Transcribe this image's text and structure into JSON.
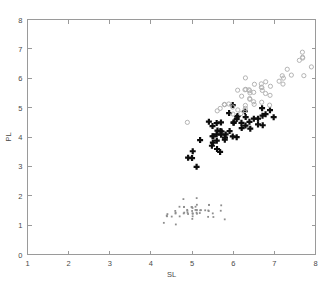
{
  "chart_data": {
    "type": "scatter",
    "title": "",
    "xlabel": "SL",
    "ylabel": "PL",
    "xlim": [
      1,
      8
    ],
    "ylim": [
      0,
      8
    ],
    "xticks": [
      1,
      2,
      3,
      4,
      5,
      6,
      7,
      8
    ],
    "yticks": [
      0,
      1,
      2,
      3,
      4,
      5,
      6,
      7,
      8
    ],
    "xtick_labels": [
      "1",
      "2",
      "3",
      "4",
      "5",
      "6",
      "7",
      "8"
    ],
    "ytick_labels": [
      "0",
      "1",
      "2",
      "3",
      "4",
      "5",
      "6",
      "7",
      "8"
    ],
    "grid": false,
    "legend": "none",
    "colors": {
      "setosa": "#8e8e8e",
      "versicolor": "#0d0d0d",
      "virginica": "#b4b4b4",
      "axis": "#9a9a9a",
      "text": "#4a4a4a",
      "background": "#ffffff"
    },
    "series": [
      {
        "name": "setosa",
        "marker": "dot",
        "color": "#8e8e8e",
        "points": [
          [
            5.1,
            1.4
          ],
          [
            4.9,
            1.4
          ],
          [
            4.7,
            1.3
          ],
          [
            4.6,
            1.5
          ],
          [
            5.0,
            1.4
          ],
          [
            5.4,
            1.7
          ],
          [
            4.6,
            1.4
          ],
          [
            5.0,
            1.5
          ],
          [
            4.4,
            1.4
          ],
          [
            4.9,
            1.5
          ],
          [
            5.4,
            1.5
          ],
          [
            4.8,
            1.6
          ],
          [
            4.8,
            1.4
          ],
          [
            4.3,
            1.1
          ],
          [
            5.8,
            1.2
          ],
          [
            5.7,
            1.5
          ],
          [
            5.4,
            1.3
          ],
          [
            5.1,
            1.4
          ],
          [
            5.7,
            1.7
          ],
          [
            5.1,
            1.5
          ],
          [
            5.4,
            1.7
          ],
          [
            5.1,
            1.5
          ],
          [
            4.6,
            1.0
          ],
          [
            5.1,
            1.7
          ],
          [
            4.8,
            1.9
          ],
          [
            5.0,
            1.6
          ],
          [
            5.0,
            1.6
          ],
          [
            5.2,
            1.5
          ],
          [
            5.2,
            1.4
          ],
          [
            4.7,
            1.6
          ],
          [
            4.8,
            1.6
          ],
          [
            5.4,
            1.5
          ],
          [
            5.2,
            1.5
          ],
          [
            5.5,
            1.4
          ],
          [
            4.9,
            1.5
          ],
          [
            5.0,
            1.2
          ],
          [
            5.5,
            1.3
          ],
          [
            4.9,
            1.4
          ],
          [
            4.4,
            1.3
          ],
          [
            5.1,
            1.5
          ],
          [
            5.0,
            1.3
          ],
          [
            4.5,
            1.3
          ],
          [
            4.4,
            1.3
          ],
          [
            5.0,
            1.6
          ],
          [
            5.1,
            1.9
          ],
          [
            4.8,
            1.4
          ],
          [
            5.1,
            1.6
          ],
          [
            4.6,
            1.4
          ],
          [
            5.3,
            1.5
          ],
          [
            5.0,
            1.4
          ]
        ]
      },
      {
        "name": "versicolor",
        "marker": "plus-filled",
        "color": "#0d0d0d",
        "points": [
          [
            7.0,
            4.7
          ],
          [
            6.4,
            4.5
          ],
          [
            6.9,
            4.9
          ],
          [
            5.5,
            4.0
          ],
          [
            6.5,
            4.6
          ],
          [
            5.7,
            4.5
          ],
          [
            6.3,
            4.7
          ],
          [
            4.9,
            3.3
          ],
          [
            6.6,
            4.6
          ],
          [
            5.2,
            3.9
          ],
          [
            5.0,
            3.5
          ],
          [
            5.9,
            4.2
          ],
          [
            6.0,
            4.0
          ],
          [
            6.1,
            4.7
          ],
          [
            5.6,
            3.6
          ],
          [
            6.7,
            4.4
          ],
          [
            5.6,
            4.5
          ],
          [
            5.8,
            4.1
          ],
          [
            6.2,
            4.5
          ],
          [
            5.6,
            3.9
          ],
          [
            5.9,
            4.8
          ],
          [
            6.1,
            4.0
          ],
          [
            6.3,
            4.9
          ],
          [
            6.1,
            4.7
          ],
          [
            6.4,
            4.3
          ],
          [
            6.6,
            4.4
          ],
          [
            6.8,
            4.8
          ],
          [
            6.7,
            5.0
          ],
          [
            6.0,
            4.5
          ],
          [
            5.7,
            3.5
          ],
          [
            5.5,
            3.8
          ],
          [
            5.5,
            3.7
          ],
          [
            5.8,
            3.9
          ],
          [
            6.0,
            5.1
          ],
          [
            5.4,
            4.5
          ],
          [
            6.0,
            4.5
          ],
          [
            6.7,
            4.7
          ],
          [
            6.3,
            4.4
          ],
          [
            5.6,
            4.1
          ],
          [
            5.5,
            4.0
          ],
          [
            5.5,
            4.4
          ],
          [
            6.1,
            4.6
          ],
          [
            5.8,
            4.0
          ],
          [
            5.0,
            3.3
          ],
          [
            5.6,
            4.2
          ],
          [
            5.7,
            4.2
          ],
          [
            5.7,
            4.2
          ],
          [
            6.2,
            4.3
          ],
          [
            5.1,
            3.0
          ],
          [
            5.7,
            4.1
          ]
        ]
      },
      {
        "name": "virginica",
        "marker": "circle-open",
        "color": "#b4b4b4",
        "points": [
          [
            6.3,
            6.0
          ],
          [
            5.8,
            5.1
          ],
          [
            7.1,
            5.9
          ],
          [
            6.3,
            5.6
          ],
          [
            6.5,
            5.8
          ],
          [
            7.6,
            6.6
          ],
          [
            4.9,
            4.5
          ],
          [
            7.3,
            6.3
          ],
          [
            6.7,
            5.8
          ],
          [
            7.2,
            6.1
          ],
          [
            6.5,
            5.1
          ],
          [
            6.4,
            5.3
          ],
          [
            6.8,
            5.5
          ],
          [
            5.7,
            5.0
          ],
          [
            5.8,
            5.1
          ],
          [
            6.4,
            5.3
          ],
          [
            6.5,
            5.5
          ],
          [
            7.7,
            6.7
          ],
          [
            7.7,
            6.9
          ],
          [
            6.0,
            5.0
          ],
          [
            6.9,
            5.7
          ],
          [
            5.6,
            4.9
          ],
          [
            7.7,
            6.7
          ],
          [
            6.3,
            4.9
          ],
          [
            6.7,
            5.7
          ],
          [
            7.2,
            6.0
          ],
          [
            6.2,
            4.8
          ],
          [
            6.1,
            4.9
          ],
          [
            6.4,
            5.6
          ],
          [
            7.2,
            5.8
          ],
          [
            7.4,
            6.1
          ],
          [
            7.9,
            6.4
          ],
          [
            6.4,
            5.6
          ],
          [
            6.3,
            5.1
          ],
          [
            6.1,
            5.6
          ],
          [
            7.7,
            6.1
          ],
          [
            6.3,
            5.6
          ],
          [
            6.4,
            5.5
          ],
          [
            6.0,
            4.8
          ],
          [
            6.9,
            5.4
          ],
          [
            6.7,
            5.6
          ],
          [
            6.9,
            5.1
          ],
          [
            5.8,
            5.1
          ],
          [
            6.8,
            5.9
          ],
          [
            6.7,
            5.7
          ],
          [
            6.7,
            5.2
          ],
          [
            6.3,
            5.0
          ],
          [
            6.5,
            5.2
          ],
          [
            6.2,
            5.4
          ],
          [
            5.9,
            5.1
          ]
        ]
      }
    ]
  }
}
